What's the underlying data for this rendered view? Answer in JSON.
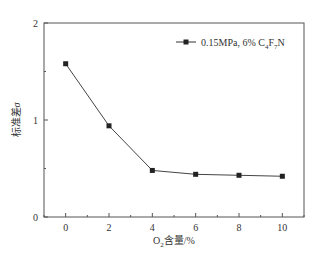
{
  "chart_data": {
    "type": "line",
    "title": "",
    "xlabel": "O2含量/%",
    "xlabel_parts": {
      "main": "O",
      "sub": "2",
      "rest": "含量/%"
    },
    "ylabel": "标准差σ",
    "ylabel_parts": {
      "main": "标准差",
      "italic": "σ"
    },
    "xlim": [
      -1,
      11
    ],
    "ylim": [
      0,
      2
    ],
    "x_ticks": [
      0,
      2,
      4,
      6,
      8,
      10
    ],
    "x_tick_labels": [
      "0",
      "2",
      "4",
      "6",
      "8",
      "10"
    ],
    "y_ticks": [
      0,
      1,
      2
    ],
    "y_tick_labels": [
      "0",
      "1",
      "2"
    ],
    "grid": false,
    "legend_position": "upper right",
    "x": [
      0,
      2,
      4,
      6,
      8,
      10
    ],
    "series": [
      {
        "name": "0.15MPa, 6% C4F7N",
        "legend_parts": {
          "prefix": "0.15MPa, 6% C",
          "s1": "4",
          "mid": "F",
          "s2": "7",
          "suffix": "N"
        },
        "marker": "square",
        "color": "#333333",
        "values": [
          1.58,
          0.94,
          0.48,
          0.44,
          0.43,
          0.42
        ]
      }
    ]
  }
}
